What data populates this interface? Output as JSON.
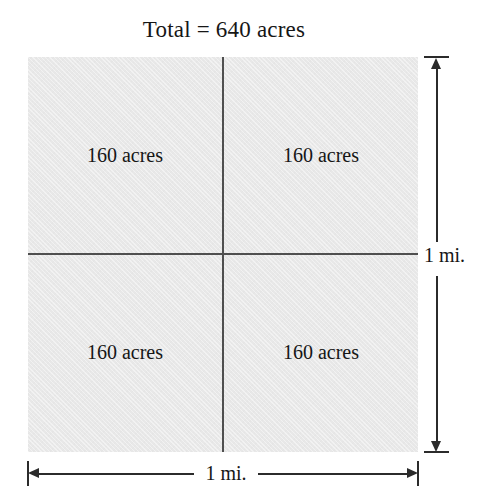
{
  "figure": {
    "title": "Total = 640 acres",
    "caption_units": "acres",
    "colors": {
      "fill": "#e8e8e8",
      "divider": "#4f4f4f",
      "dimension_line": "#2b2b2b",
      "text": "#161616",
      "background": "#ffffff"
    }
  },
  "quadrants": [
    {
      "position": "top-left",
      "label": "160 acres",
      "value": 160
    },
    {
      "position": "top-right",
      "label": "160 acres",
      "value": 160
    },
    {
      "position": "bottom-left",
      "label": "160 acres",
      "value": 160
    },
    {
      "position": "bottom-right",
      "label": "160 acres",
      "value": 160
    }
  ],
  "dimensions": {
    "vertical": {
      "label": "1 mi.",
      "value": 1,
      "unit": "mi."
    },
    "horizontal": {
      "label": "1 mi.",
      "value": 1,
      "unit": "mi."
    }
  },
  "chart_data": {
    "type": "diagram",
    "title": "Total = 640 acres",
    "categories": [
      "top-left",
      "top-right",
      "bottom-left",
      "bottom-right"
    ],
    "values": [
      160,
      160,
      160,
      160
    ],
    "value_unit": "acres",
    "total": 640,
    "side_length": 1,
    "side_unit": "mi.",
    "xlabel": "1 mi.",
    "ylabel": "1 mi.",
    "grid": true,
    "legend": "none"
  }
}
